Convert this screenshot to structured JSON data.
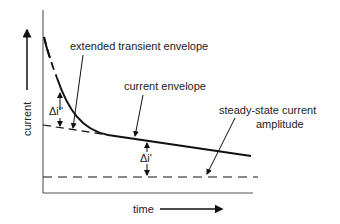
{
  "diagram": {
    "axes": {
      "y_label": "current",
      "x_label": "time"
    },
    "labels": {
      "extended_transient_envelope": "extended transient envelope",
      "current_envelope": "current envelope",
      "steady_state_line1": "steady-state current",
      "steady_state_line2": "amplitude",
      "delta_i_double_prime": "Δi''",
      "delta_i_prime": "Δi'"
    },
    "colors": {
      "line": "#111111",
      "axis": "#444444",
      "background": "#ffffff"
    }
  }
}
